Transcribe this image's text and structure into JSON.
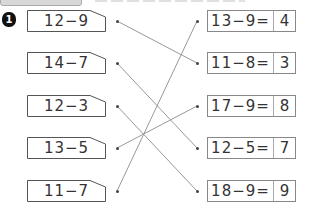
{
  "problem_number": "1",
  "left_expressions": [
    {
      "label": "12−9"
    },
    {
      "label": "14−7"
    },
    {
      "label": "12−3"
    },
    {
      "label": "13−5"
    },
    {
      "label": "11−7"
    }
  ],
  "right_equations": [
    {
      "expression": "13−9=",
      "answer": "4"
    },
    {
      "expression": "11−8=",
      "answer": "3"
    },
    {
      "expression": "17−9=",
      "answer": "8"
    },
    {
      "expression": "12−5=",
      "answer": "7"
    },
    {
      "expression": "18−9=",
      "answer": "9"
    }
  ],
  "connections": [
    {
      "from": "12−9",
      "to": "11−8="
    },
    {
      "from": "14−7",
      "to": "12−5="
    },
    {
      "from": "12−3",
      "to": "18−9="
    },
    {
      "from": "13−5",
      "to": "17−9="
    },
    {
      "from": "11−7",
      "to": "13−9="
    }
  ],
  "colors": {
    "line": "#999999",
    "border": "#555555",
    "text": "#333333"
  }
}
